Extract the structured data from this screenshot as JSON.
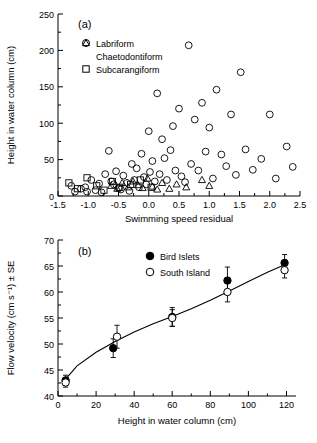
{
  "figure": {
    "panels": [
      {
        "tag": "(a)",
        "xlabel": "Swimming speed residual",
        "ylabel": "Height in water column (cm)",
        "xticks": [
          "-1.5",
          "-1.0",
          "-0.5",
          "0.0",
          "0.5",
          "1.0",
          "1.5",
          "2.0",
          "2.5"
        ],
        "yticks": [
          "0",
          "50",
          "100",
          "150",
          "200",
          "250"
        ],
        "legend": [
          {
            "marker": "circle",
            "label": "Labriform"
          },
          {
            "marker": "triangle",
            "label": "Chaetodontiform"
          },
          {
            "marker": "square",
            "label": "Subcarangiform"
          }
        ]
      },
      {
        "tag": "(b)",
        "xlabel": "Height in water column (cm)",
        "ylabel": "Flow velocity (cm s⁻¹) ± SE",
        "xticks": [
          "0",
          "20",
          "40",
          "60",
          "80",
          "100",
          "120"
        ],
        "yticks": [
          "40",
          "45",
          "50",
          "55",
          "60",
          "65",
          "70"
        ],
        "legend": [
          {
            "marker": "filled-circle",
            "label": "Bird Islets"
          },
          {
            "marker": "open-circle",
            "label": "South Island"
          }
        ]
      }
    ]
  },
  "chart_data": [
    {
      "type": "scatter",
      "title": "",
      "panel": "(a)",
      "xlabel": "Swimming speed residual",
      "ylabel": "Height in water column (cm)",
      "xlim": [
        -1.5,
        2.5
      ],
      "ylim": [
        0,
        250
      ],
      "grid": false,
      "legend_position": "top-left",
      "series": [
        {
          "name": "Labriform",
          "marker": "open-circle",
          "points": [
            [
              -1.28,
              14
            ],
            [
              -1.22,
              6
            ],
            [
              -1.12,
              10
            ],
            [
              -1.05,
              12
            ],
            [
              -1.02,
              6
            ],
            [
              -0.95,
              22
            ],
            [
              -0.88,
              8
            ],
            [
              -0.82,
              17
            ],
            [
              -0.78,
              5
            ],
            [
              -0.72,
              30
            ],
            [
              -0.66,
              62
            ],
            [
              -0.62,
              20
            ],
            [
              -0.58,
              16
            ],
            [
              -0.54,
              34
            ],
            [
              -0.5,
              11
            ],
            [
              -0.46,
              9
            ],
            [
              -0.42,
              28
            ],
            [
              -0.36,
              18
            ],
            [
              -0.32,
              7
            ],
            [
              -0.28,
              44
            ],
            [
              -0.24,
              22
            ],
            [
              -0.2,
              38
            ],
            [
              -0.16,
              12
            ],
            [
              -0.12,
              58
            ],
            [
              -0.08,
              26
            ],
            [
              -0.04,
              16
            ],
            [
              0.0,
              89
            ],
            [
              0.02,
              33
            ],
            [
              0.06,
              48
            ],
            [
              0.1,
              20
            ],
            [
              0.14,
              141
            ],
            [
              0.18,
              30
            ],
            [
              0.22,
              78
            ],
            [
              0.26,
              52
            ],
            [
              0.3,
              22
            ],
            [
              0.36,
              63
            ],
            [
              0.4,
              96
            ],
            [
              0.44,
              35
            ],
            [
              0.5,
              120
            ],
            [
              0.54,
              27
            ],
            [
              0.6,
              19
            ],
            [
              0.66,
              207
            ],
            [
              0.7,
              44
            ],
            [
              0.76,
              105
            ],
            [
              0.82,
              35
            ],
            [
              0.88,
              128
            ],
            [
              0.94,
              61
            ],
            [
              1.0,
              94
            ],
            [
              1.06,
              24
            ],
            [
              1.12,
              146
            ],
            [
              1.2,
              57
            ],
            [
              1.28,
              41
            ],
            [
              1.36,
              112
            ],
            [
              1.44,
              29
            ],
            [
              1.52,
              170
            ],
            [
              1.6,
              64
            ],
            [
              1.72,
              36
            ],
            [
              1.86,
              51
            ],
            [
              2.0,
              112
            ],
            [
              2.1,
              24
            ],
            [
              2.28,
              68
            ],
            [
              2.38,
              40
            ]
          ]
        },
        {
          "name": "Chaetodontiform",
          "marker": "open-triangle",
          "points": [
            [
              -0.62,
              14
            ],
            [
              -0.52,
              10
            ],
            [
              -0.44,
              18
            ],
            [
              -0.34,
              12
            ],
            [
              -0.26,
              20
            ],
            [
              -0.18,
              15
            ],
            [
              -0.1,
              11
            ],
            [
              -0.02,
              24
            ],
            [
              0.06,
              13
            ],
            [
              0.14,
              9
            ],
            [
              0.22,
              18
            ],
            [
              0.34,
              10
            ],
            [
              0.46,
              16
            ],
            [
              0.62,
              12
            ],
            [
              0.88,
              22
            ],
            [
              1.0,
              14
            ]
          ]
        },
        {
          "name": "Subcarangiform",
          "marker": "open-square",
          "points": [
            [
              -1.32,
              18
            ],
            [
              -1.18,
              10
            ],
            [
              -1.02,
              25
            ],
            [
              -0.86,
              14
            ],
            [
              -0.74,
              8
            ],
            [
              -0.6,
              20
            ],
            [
              -0.48,
              12
            ],
            [
              -0.3,
              16
            ],
            [
              -0.14,
              22
            ],
            [
              0.04,
              12
            ]
          ]
        }
      ]
    },
    {
      "type": "scatter",
      "panel": "(b)",
      "xlabel": "Height in water column (cm)",
      "ylabel": "Flow velocity (cm s⁻¹) ± SE",
      "xlim": [
        0,
        125
      ],
      "ylim": [
        35,
        70
      ],
      "grid": false,
      "legend_position": "top-left",
      "fit_curve": {
        "name": "logarithmic fit",
        "points": [
          [
            3,
            42.8
          ],
          [
            10,
            45.8
          ],
          [
            20,
            48.4
          ],
          [
            30,
            50.5
          ],
          [
            40,
            52.3
          ],
          [
            50,
            53.9
          ],
          [
            60,
            55.3
          ],
          [
            70,
            56.8
          ],
          [
            80,
            58.4
          ],
          [
            90,
            60.2
          ],
          [
            100,
            62.0
          ],
          [
            110,
            63.8
          ],
          [
            120,
            65.4
          ]
        ]
      },
      "series": [
        {
          "name": "Bird Islets",
          "marker": "filled-circle",
          "points": [
            {
              "x": 4,
              "y": 43.0,
              "se": 1.0
            },
            {
              "x": 29,
              "y": 49.2,
              "se": 1.8
            },
            {
              "x": 60,
              "y": 55.2,
              "se": 1.8
            },
            {
              "x": 89,
              "y": 62.2,
              "se": 2.6
            },
            {
              "x": 119,
              "y": 65.6,
              "se": 1.6
            }
          ]
        },
        {
          "name": "South Island",
          "marker": "open-circle",
          "points": [
            {
              "x": 4,
              "y": 42.6,
              "se": 0.9
            },
            {
              "x": 31,
              "y": 51.4,
              "se": 2.2
            },
            {
              "x": 60,
              "y": 55.0,
              "se": 1.6
            },
            {
              "x": 89,
              "y": 60.0,
              "se": 1.9
            },
            {
              "x": 119,
              "y": 64.2,
              "se": 1.5
            }
          ]
        }
      ]
    }
  ]
}
